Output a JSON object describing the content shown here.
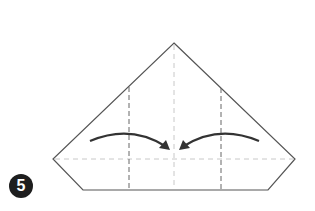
{
  "diagram": {
    "type": "origami-step",
    "step_number": "5",
    "instruction": "Valley-fold both side flaps toward the center",
    "colors": {
      "outline": "#555555",
      "mountain_crease": "#8a8a8a",
      "fold_line": "#666666",
      "center_line": "#c8c8c8",
      "arrow": "#333333",
      "badge": "#1e1e1e"
    }
  }
}
